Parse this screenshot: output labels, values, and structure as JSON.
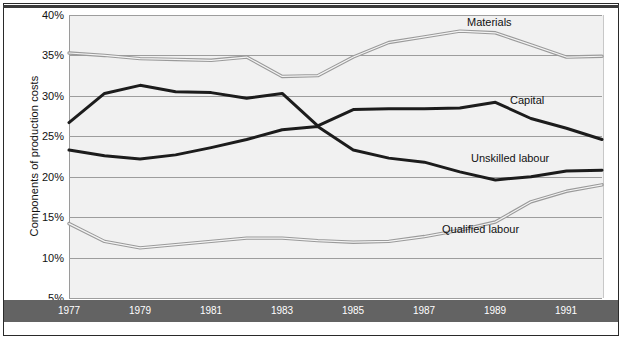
{
  "figure": {
    "y_axis_title": "Components of production costs",
    "background": "#f1f1f1",
    "axis_band_color": "#636363",
    "gridline_color": "#9d9d9d"
  },
  "y_ticks": [
    {
      "label": "40%",
      "value": 40
    },
    {
      "label": "35%",
      "value": 35
    },
    {
      "label": "30%",
      "value": 30
    },
    {
      "label": "25%",
      "value": 25
    },
    {
      "label": "20%",
      "value": 20
    },
    {
      "label": "15%",
      "value": 15
    },
    {
      "label": "10%",
      "value": 10
    },
    {
      "label": "5%",
      "value": 5
    }
  ],
  "x_ticks": [
    {
      "label": "1977",
      "value": 1977
    },
    {
      "label": "1979",
      "value": 1979
    },
    {
      "label": "1981",
      "value": 1981
    },
    {
      "label": "1983",
      "value": 1983
    },
    {
      "label": "1985",
      "value": 1985
    },
    {
      "label": "1987",
      "value": 1987
    },
    {
      "label": "1989",
      "value": 1989
    },
    {
      "label": "1991",
      "value": 1991
    }
  ],
  "series_labels": {
    "materials": "Materials",
    "capital": "Capital",
    "unskilled": "Unskilled labour",
    "qualified": "Qualified labour"
  },
  "chart_data": {
    "type": "line",
    "title": "",
    "xlabel": "",
    "ylabel": "Components of production costs",
    "xlim": [
      1977,
      1992
    ],
    "ylim": [
      5,
      40
    ],
    "grid": true,
    "legend": "inline-annotations",
    "x": [
      1977,
      1978,
      1979,
      1980,
      1981,
      1982,
      1983,
      1984,
      1985,
      1986,
      1987,
      1988,
      1989,
      1990,
      1991,
      1992
    ],
    "series": [
      {
        "name": "Materials",
        "style": "light-double-stroke",
        "color": "#9a9a9a",
        "values": [
          35.3,
          35.0,
          34.6,
          34.5,
          34.4,
          34.8,
          32.4,
          32.5,
          34.8,
          36.6,
          37.3,
          38.0,
          37.8,
          36.3,
          34.8,
          34.9
        ]
      },
      {
        "name": "Capital",
        "style": "dark-thick",
        "color": "#1c1c1c",
        "values": [
          26.7,
          30.3,
          31.3,
          30.5,
          30.4,
          29.7,
          30.3,
          26.3,
          28.3,
          28.4,
          28.4,
          28.5,
          29.2,
          27.2,
          26.0,
          24.6
        ]
      },
      {
        "name": "Unskilled labour",
        "style": "dark-thick",
        "color": "#1c1c1c",
        "values": [
          23.3,
          22.6,
          22.2,
          22.7,
          23.6,
          24.6,
          25.8,
          26.2,
          23.3,
          22.3,
          21.8,
          20.6,
          19.6,
          20.0,
          20.7,
          20.8
        ]
      },
      {
        "name": "Qualified labour",
        "style": "light-double-stroke",
        "color": "#9a9a9a",
        "values": [
          14.2,
          12.0,
          11.2,
          11.6,
          12.0,
          12.4,
          12.4,
          12.1,
          11.9,
          12.0,
          12.6,
          13.4,
          14.4,
          16.9,
          18.2,
          19.0
        ]
      }
    ],
    "annotations": [
      {
        "text": "Materials",
        "x": 1988.2,
        "y": 39.0
      },
      {
        "text": "Capital",
        "x": 1989.4,
        "y": 29.4
      },
      {
        "text": "Unskilled labour",
        "x": 1988.3,
        "y": 22.2
      },
      {
        "text": "Qualified labour",
        "x": 1987.5,
        "y": 13.4
      }
    ]
  }
}
